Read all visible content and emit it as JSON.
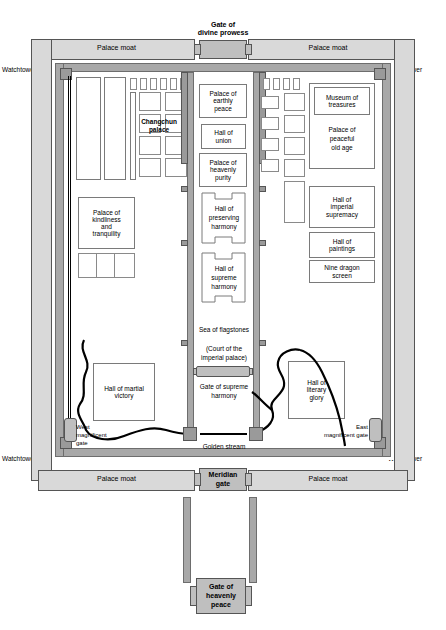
{
  "map": {
    "title": "Plan of the Forbidden City",
    "width": 446,
    "height": 630,
    "colors": {
      "wall": "#a8a8a8",
      "moat": "#d9d9d9",
      "gate": "#bfbfbf",
      "room_fill": "#ffffff",
      "outline": "#555555",
      "stream": "#000000"
    }
  },
  "gates": {
    "divine_prowess": "Gate of\ndivine prowess",
    "divine_prowess_line1": "Gate of",
    "divine_prowess_line2": "divine prowess",
    "meridian_line1": "Meridian",
    "meridian_line2": "gate",
    "heavenly_peace_line1": "Gate of",
    "heavenly_peace_line2": "heavenly",
    "heavenly_peace_line3": "peace",
    "west_magnificent_line1": "West",
    "west_magnificent_line2": "magnificent",
    "west_magnificent_line3": "gate",
    "east_magnificent_line1": "East",
    "east_magnificent_line2": "magnificent gate",
    "supreme_harmony": "Gate of supreme\nharmony"
  },
  "moats": {
    "top_left": "Palace moat",
    "top_right": "Palace moat",
    "bottom_left": "Palace moat",
    "bottom_right": "Palace moat"
  },
  "watchtowers": {
    "top_left": "Watchtower",
    "top_right": "Watchtower",
    "bottom_left": "Watchtower",
    "bottom_right": "Watchtower"
  },
  "central_axis": [
    {
      "name": "palace-of-earthly-peace",
      "label": "Palace of\nearthly\npeace"
    },
    {
      "name": "hall-of-union",
      "label": "Hall of\nunion"
    },
    {
      "name": "palace-of-heavenly-purity",
      "label": "Palace of\nheavenly\npurity"
    },
    {
      "name": "hall-of-preserving-harmony",
      "label": "Hall of\npreserving\nharmony"
    },
    {
      "name": "hall-of-supreme-harmony",
      "label": "Hall of\nsupreme\nharmony"
    }
  ],
  "labels": {
    "palace_earthly_peace_l1": "Palace of",
    "palace_earthly_peace_l2": "earthly",
    "palace_earthly_peace_l3": "peace",
    "hall_union_l1": "Hall of",
    "hall_union_l2": "union",
    "palace_heavenly_purity_l1": "Palace of",
    "palace_heavenly_purity_l2": "heavenly",
    "palace_heavenly_purity_l3": "purity",
    "hall_preserving_l1": "Hall of",
    "hall_preserving_l2": "preserving",
    "hall_preserving_l3": "harmony",
    "hall_supreme_l1": "Hall of",
    "hall_supreme_l2": "supreme",
    "hall_supreme_l3": "harmony",
    "sea_of_flagstones": "Sea of flagstones",
    "court_of_imperial_palace": "(Court of the\nimperial palace)",
    "court_l1": "(Court of the",
    "court_l2": "imperial palace)",
    "gate_supreme_l1": "Gate of supreme",
    "gate_supreme_l2": "harmony",
    "golden_stream": "Golden stream",
    "changchun_palace_l1": "Changchun",
    "changchun_palace_l2": "palace",
    "palace_kindliness_l1": "Palace of",
    "palace_kindliness_l2": "kindliness",
    "palace_kindliness_l3": "and",
    "palace_kindliness_l4": "tranquility",
    "hall_martial_victory_l1": "Hall of martial",
    "hall_martial_victory_l2": "victory",
    "hall_literary_glory_l1": "Hall of",
    "hall_literary_glory_l2": "literary",
    "hall_literary_glory_l3": "glory",
    "museum_treasures_l1": "Museum of",
    "museum_treasures_l2": "treasures",
    "palace_peaceful_old_age_l1": "Palace of",
    "palace_peaceful_old_age_l2": "peaceful",
    "palace_peaceful_old_age_l3": "old age",
    "hall_imperial_supremacy_l1": "Hall of",
    "hall_imperial_supremacy_l2": "imperial",
    "hall_imperial_supremacy_l3": "supremacy",
    "hall_paintings_l1": "Hall of",
    "hall_paintings_l2": "paintings",
    "nine_dragon_screen_l1": "Nine dragon",
    "nine_dragon_screen_l2": "screen"
  },
  "west_small_rooms_count": 6,
  "east_small_rooms_count": 4,
  "changchun_grid_rows": 4,
  "changchun_grid_cols": 2,
  "east_grid_rows": 4,
  "east_grid_cols": 2
}
